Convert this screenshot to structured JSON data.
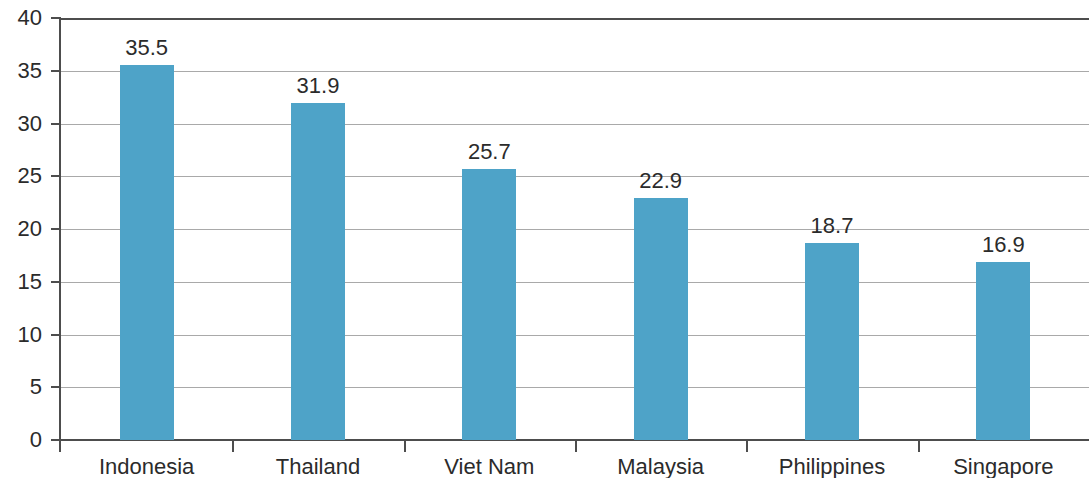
{
  "chart_data": {
    "type": "bar",
    "title": "",
    "subtitle": "",
    "xlabel": "",
    "ylabel": "",
    "categories": [
      "Indonesia",
      "Thailand",
      "Viet Nam",
      "Malaysia",
      "Philippines",
      "Singapore"
    ],
    "values": [
      35.5,
      31.9,
      25.7,
      22.9,
      18.7,
      16.9
    ],
    "value_labels": [
      "35.5",
      "31.9",
      "25.7",
      "22.9",
      "18.7",
      "16.9"
    ],
    "ylim": [
      0,
      40
    ],
    "ytick_values": [
      0,
      5,
      10,
      15,
      20,
      25,
      30,
      35,
      40
    ],
    "ytick_labels": [
      "0",
      "5",
      "10",
      "15",
      "20",
      "25",
      "30",
      "35",
      "40"
    ],
    "grid": true,
    "grid_axis": "y",
    "legend": false,
    "legend_position": "none",
    "series": [
      {
        "name": "",
        "values": [
          35.5,
          31.9,
          25.7,
          22.9,
          18.7,
          16.9
        ]
      }
    ],
    "colors": {
      "bar": "#4ea3c8",
      "gridline": "#a9a9a9",
      "axis": "#4d4d4d",
      "text": "#2b2b2b",
      "background": "#ffffff"
    }
  }
}
